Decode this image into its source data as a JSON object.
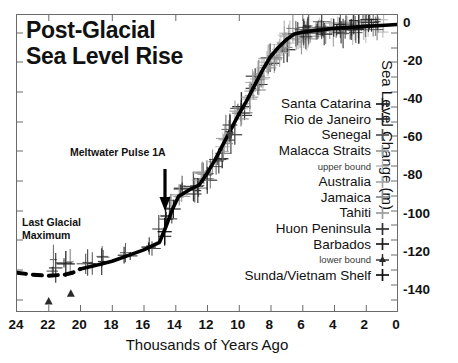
{
  "title": {
    "line1": "Post-Glacial",
    "line2": "Sea Level Rise"
  },
  "annotations": {
    "meltwater_pulse": "Meltwater Pulse 1A",
    "lgm_line1": "Last Glacial",
    "lgm_line2": "Maximum"
  },
  "axes": {
    "xlabel": "Thousands of Years Ago",
    "ylabel": "Sea Level Change (m)",
    "xticks": [
      "24",
      "22",
      "20",
      "18",
      "16",
      "14",
      "12",
      "10",
      "8",
      "6",
      "4",
      "2",
      "0"
    ],
    "yticks": [
      "0",
      "-20",
      "-40",
      "-60",
      "-80",
      "-100",
      "-120",
      "-140"
    ]
  },
  "legend": {
    "entries": [
      {
        "label": "Santa Catarina",
        "marker": "plus-icon",
        "color": "#1d1d1d",
        "small": false
      },
      {
        "label": "Rio de Janeiro",
        "marker": "plus-icon",
        "color": "#2b2b2b",
        "small": false
      },
      {
        "label": "Senegal",
        "marker": "plus-icon",
        "color": "#555555",
        "small": false
      },
      {
        "label": "Malacca Straits",
        "marker": "plus-icon",
        "color": "#9a9a9a",
        "small": false
      },
      {
        "label": "upper bound",
        "marker": "plus-icon",
        "color": "#b5b5b5",
        "small": true
      },
      {
        "label": "Australia",
        "marker": "plus-icon",
        "color": "#a8a8a8",
        "small": false
      },
      {
        "label": "Jamaica",
        "marker": "plus-icon",
        "color": "#8a8a8a",
        "small": false
      },
      {
        "label": "Tahiti",
        "marker": "plus-icon",
        "color": "#9c9c9c",
        "small": false
      },
      {
        "label": "Huon Peninsula",
        "marker": "plus-icon",
        "color": "#333333",
        "small": false
      },
      {
        "label": "Barbados",
        "marker": "plus-icon",
        "color": "#1d1d1d",
        "small": false
      },
      {
        "label": "lower bound",
        "marker": "triangle-plus-icon",
        "color": "#2a2a2a",
        "small": true
      },
      {
        "label": "Sunda/Vietnam Shelf",
        "marker": "plus-icon",
        "color": "#111111",
        "small": false
      }
    ]
  },
  "chart_data": {
    "type": "line",
    "title": "Post-Glacial Sea Level Rise",
    "xlabel": "Thousands of Years Ago",
    "ylabel": "Sea Level Change (m)",
    "xlim": [
      24,
      0
    ],
    "ylim": [
      -150,
      5
    ],
    "x_reversed": true,
    "grid": false,
    "legend_position": "right-inside",
    "series": [
      {
        "name": "Sea level curve (fit)",
        "style": "solid-thick-black",
        "x": [
          20.0,
          19.0,
          18.0,
          17.0,
          16.0,
          15.0,
          14.6,
          14.2,
          13.8,
          13.0,
          12.5,
          12.0,
          11.5,
          11.0,
          10.5,
          10.0,
          9.5,
          9.0,
          8.5,
          8.0,
          7.5,
          7.0,
          6.5,
          6.0,
          5.0,
          4.0,
          3.0,
          2.0,
          1.0,
          0.0
        ],
        "y": [
          -128,
          -126,
          -124,
          -121,
          -118,
          -114,
          -106,
          -97,
          -90,
          -86,
          -84,
          -78,
          -71,
          -63,
          -55,
          -47,
          -40,
          -32,
          -24,
          -17,
          -12,
          -8,
          -5,
          -4,
          -3,
          -2,
          -1.5,
          -1,
          -0.5,
          0
        ]
      },
      {
        "name": "Last Glacial Maximum (dashed extrapolation)",
        "style": "dashed-thick-black",
        "x": [
          24.0,
          23.0,
          22.0,
          21.0,
          20.5,
          20.0
        ],
        "y": [
          -130,
          -131,
          -131.5,
          -131,
          -130,
          -128
        ]
      }
    ],
    "scatter_groups": [
      {
        "name": "Sunda/Vietnam Shelf",
        "color": "#111111",
        "marker": "plus-errorbar",
        "x": [
          21.5,
          20.8,
          19.5,
          18.5,
          17.0,
          15.5,
          14.8,
          14.4
        ],
        "y": [
          -126,
          -127,
          -124,
          -122,
          -119,
          -115,
          -109,
          -100
        ]
      },
      {
        "name": "Barbados",
        "color": "#1d1d1d",
        "marker": "plus-errorbar",
        "x": [
          14.2,
          13.6,
          12.8,
          12.0,
          11.2,
          10.4,
          9.6,
          8.8,
          8.0,
          7.2
        ],
        "y": [
          -95,
          -88,
          -85,
          -78,
          -69,
          -56,
          -43,
          -29,
          -18,
          -11
        ]
      },
      {
        "name": "Huon Peninsula",
        "color": "#333333",
        "marker": "plus-errorbar",
        "x": [
          13.0,
          12.2,
          11.4,
          10.6,
          9.8,
          9.0
        ],
        "y": [
          -86,
          -80,
          -72,
          -58,
          -45,
          -31
        ]
      },
      {
        "name": "Tahiti",
        "color": "#9c9c9c",
        "marker": "plus-errorbar",
        "x": [
          13.5,
          12.4,
          11.0,
          10.0,
          9.2,
          8.4,
          7.6
        ],
        "y": [
          -89,
          -79,
          -63,
          -47,
          -35,
          -22,
          -14
        ]
      },
      {
        "name": "Jamaica",
        "color": "#8a8a8a",
        "marker": "plus-errorbar",
        "x": [
          10.8,
          9.4,
          8.6,
          7.8,
          7.0,
          6.2
        ],
        "y": [
          -60,
          -41,
          -27,
          -16,
          -9,
          -6
        ]
      },
      {
        "name": "Australia",
        "color": "#a8a8a8",
        "marker": "plus-errorbar",
        "x": [
          8.2,
          7.4,
          6.6,
          5.8,
          5.0,
          4.0,
          3.0,
          2.0,
          1.0
        ],
        "y": [
          -19,
          -12,
          -7,
          -5,
          -3,
          -2,
          -1.5,
          -1,
          -0.5
        ]
      },
      {
        "name": "Malacca Straits",
        "color": "#9a9a9a",
        "marker": "plus-errorbar",
        "x": [
          9.0,
          8.0,
          7.0,
          6.0,
          5.0,
          4.0,
          3.0,
          2.0
        ],
        "y": [
          -30,
          -18,
          -8,
          -4,
          -3,
          -2,
          -1,
          -0.5
        ]
      },
      {
        "name": "Senegal",
        "color": "#555555",
        "marker": "plus-errorbar",
        "x": [
          6.5,
          5.5,
          4.5,
          3.5,
          2.5,
          1.5
        ],
        "y": [
          -5,
          -3,
          -2,
          -1.5,
          -1,
          -0.5
        ]
      },
      {
        "name": "Rio de Janeiro",
        "color": "#2b2b2b",
        "marker": "plus-errorbar",
        "x": [
          6.0,
          5.0,
          4.0,
          3.0,
          2.0
        ],
        "y": [
          -4,
          -2.5,
          -1.5,
          -1,
          -0.5
        ]
      },
      {
        "name": "Santa Catarina",
        "color": "#1d1d1d",
        "marker": "plus-errorbar",
        "x": [
          5.5,
          4.5,
          3.5,
          2.5,
          1.5
        ],
        "y": [
          -3,
          -2,
          -1.5,
          -1,
          -0.5
        ]
      },
      {
        "name": "lower bound",
        "color": "#2a2a2a",
        "marker": "triangle",
        "x": [
          22.0,
          20.6
        ],
        "y": [
          -145,
          -141
        ]
      }
    ],
    "annotations": [
      {
        "text": "Meltwater Pulse 1A",
        "x": 15.6,
        "y": -88,
        "arrow_to_x": 14.5,
        "arrow_to_y": -103
      },
      {
        "text": "Last Glacial Maximum",
        "x": 22.6,
        "y": -112
      }
    ]
  }
}
